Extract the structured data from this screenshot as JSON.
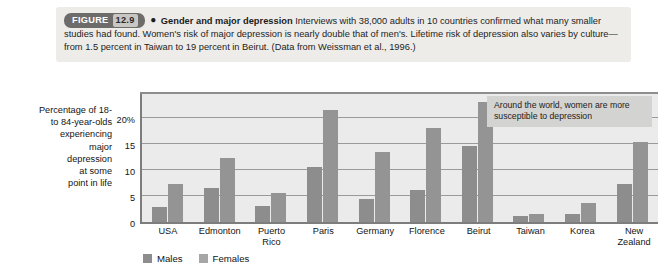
{
  "figure": {
    "badge_label": "FIGURE",
    "number": "12.9",
    "bullet": "●",
    "title": "Gender and major depression",
    "body": "Interviews with 38,000 adults in 10 countries confirmed what many smaller studies had found. Women's risk of major depression is nearly double that of men's. Lifetime risk of depression also varies by culture—from 1.5 percent in Taiwan to 19 percent in Beirut. (Data from Weissman et al., 1996.)"
  },
  "annotation": {
    "callout_text": "Around the world, women are more susceptible to depression"
  },
  "legend": {
    "items": [
      {
        "label": "Males",
        "color": "#8d8d8d"
      },
      {
        "label": "Females",
        "color": "#a6a6a6"
      }
    ]
  },
  "axis": {
    "y_title": "Percentage of 18- to 84-year-olds experiencing major depression at some point in life",
    "y_title_lines": [
      "Percentage of 18-",
      "to 84-year-olds",
      "experiencing",
      "major",
      "depression",
      "at some",
      "point in life"
    ],
    "y_tick_labels": [
      "20%",
      "15",
      "10",
      "5",
      "0"
    ]
  },
  "chart_data": {
    "type": "bar",
    "title": "Gender and major depression",
    "xlabel": "",
    "ylabel": "Percentage of 18- to 84-year-olds experiencing major depression at some point in life",
    "ylim": [
      0,
      25
    ],
    "yticks": [
      0,
      5,
      10,
      15,
      20
    ],
    "ytick_labels": [
      "0",
      "5",
      "10",
      "15",
      "20%"
    ],
    "grid": true,
    "legend_position": "bottom-left",
    "categories": [
      "USA",
      "Edmonton",
      "Puerto Rico",
      "Paris",
      "Germany",
      "Florence",
      "Beirut",
      "Taiwan",
      "Korea",
      "New Zealand"
    ],
    "category_label_lines": [
      [
        "USA"
      ],
      [
        "Edmonton"
      ],
      [
        "Puerto",
        "Rico"
      ],
      [
        "Paris"
      ],
      [
        "Germany"
      ],
      [
        "Florence"
      ],
      [
        "Beirut"
      ],
      [
        "Taiwan"
      ],
      [
        "Korea"
      ],
      [
        "New",
        "Zealand"
      ]
    ],
    "series": [
      {
        "name": "Males",
        "color": "#8d8d8d",
        "values": [
          2.8,
          6.5,
          3.1,
          10.5,
          4.5,
          6.2,
          14.6,
          1.2,
          1.6,
          7.4
        ]
      },
      {
        "name": "Females",
        "color": "#949494",
        "values": [
          7.4,
          12.4,
          5.5,
          21.6,
          13.4,
          18.1,
          23.1,
          1.6,
          3.7,
          15.4
        ]
      }
    ]
  }
}
